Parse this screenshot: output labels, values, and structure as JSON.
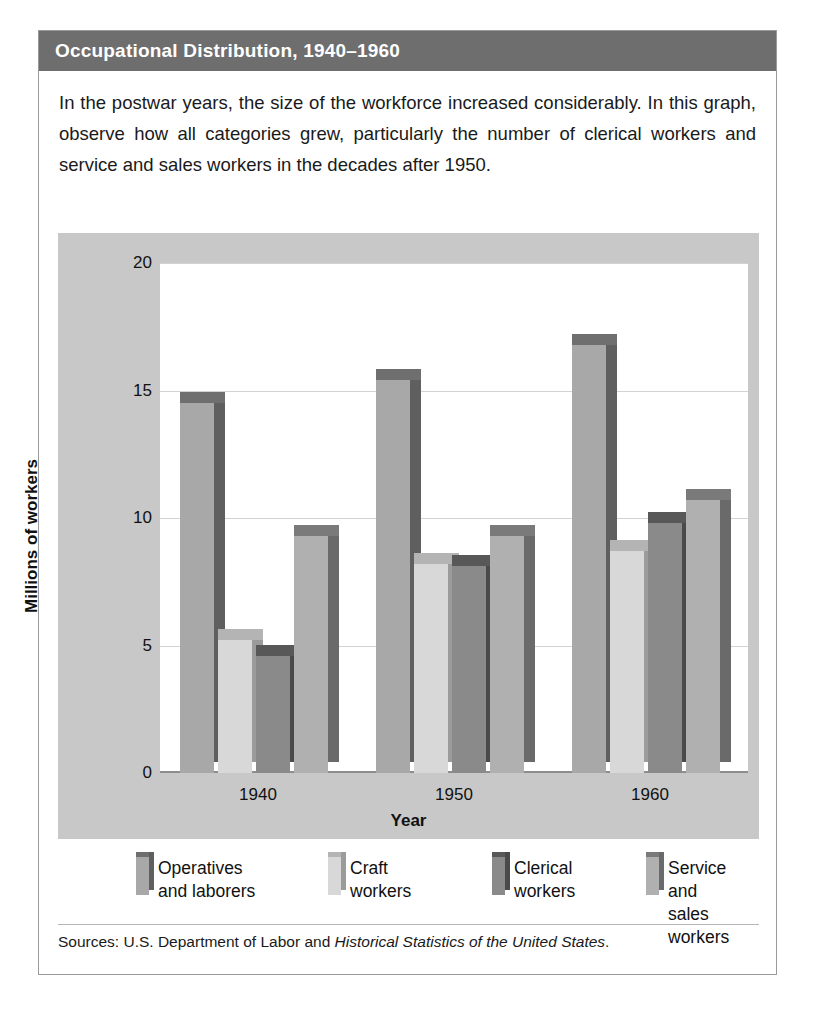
{
  "figure": {
    "title": "Occupational Distribution, 1940–1960",
    "description": "In the postwar years, the size of the workforce increased considerably. In this graph, observe how all categories grew, particularly the number of clerical workers and service and sales workers in the decades after 1950.",
    "source_prefix": "Sources: U.S. Department of Labor and ",
    "source_italic": "Historical Statistics of the United States",
    "source_suffix": "."
  },
  "colors": {
    "header_bg": "#6e6e6e",
    "panel_bg": "#c8c8c8",
    "plot_bg": "#ffffff",
    "gridline": "#d2d2d2",
    "series_1": "#a8a8a8",
    "series_1_side": "#5f5f5f",
    "series_1_top": "#6f6f6f",
    "series_2": "#d8d8d8",
    "series_2_side": "#9b9b9b",
    "series_2_top": "#b4b4b4",
    "series_3": "#8a8a8a",
    "series_3_side": "#4a4a4a",
    "series_3_top": "#585858",
    "series_4": "#b0b0b0",
    "series_4_side": "#6a6a6a",
    "series_4_top": "#7a7a7a"
  },
  "chart_data": {
    "type": "bar",
    "title": "Occupational Distribution, 1940–1960",
    "xlabel": "Year",
    "ylabel": "Millions of workers",
    "categories": [
      "1940",
      "1950",
      "1960"
    ],
    "yticks": [
      "0",
      "5",
      "10",
      "15",
      "20"
    ],
    "ylim": [
      0,
      20
    ],
    "grid": true,
    "legend_position": "bottom",
    "series": [
      {
        "name": "Operatives\nand laborers",
        "values": [
          14.5,
          15.4,
          16.8
        ]
      },
      {
        "name": "Craft\nworkers",
        "values": [
          5.2,
          8.2,
          8.7
        ]
      },
      {
        "name": "Clerical\nworkers",
        "values": [
          4.6,
          8.1,
          9.8
        ]
      },
      {
        "name": "Service and\nsales workers",
        "values": [
          9.3,
          9.3,
          10.7
        ]
      }
    ]
  }
}
